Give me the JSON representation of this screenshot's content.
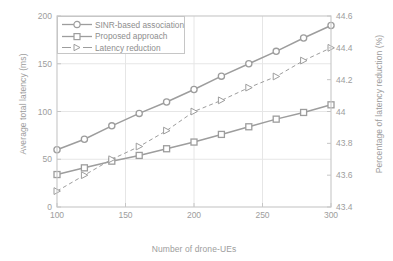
{
  "chart_data": {
    "type": "line",
    "title": "",
    "xlabel": "Number of drone-UEs",
    "ylabel": "Average total latency (ms)",
    "ylabel_right": "Percentage of latency reduction (%)",
    "xlim": [
      100,
      300
    ],
    "ylim": [
      0,
      200
    ],
    "ylim_right": [
      43.4,
      44.6
    ],
    "xticks": [
      100,
      150,
      200,
      250,
      300
    ],
    "yticks": [
      0,
      50,
      100,
      150,
      200
    ],
    "yticks_right": [
      43.4,
      43.6,
      43.8,
      44,
      44.2,
      44.4,
      44.6
    ],
    "xtick_labels": [
      "100",
      "150",
      "200",
      "250",
      "300"
    ],
    "ytick_labels": [
      "0",
      "50",
      "100",
      "150",
      "200"
    ],
    "ytick_right_labels": [
      "43.4",
      "43.6",
      "43.8",
      "44",
      "44.2",
      "44.4",
      "44.6"
    ],
    "grid": true,
    "legend_position": "top-left",
    "x": [
      100,
      120,
      140,
      160,
      180,
      200,
      220,
      240,
      260,
      280,
      300
    ],
    "series": [
      {
        "name": "SINR-based association",
        "axis": "left",
        "marker": "circle",
        "linestyle": "solid",
        "color": "#9d9d9d",
        "values": [
          60,
          71,
          85,
          98,
          110,
          123,
          137,
          150,
          163,
          177,
          190
        ]
      },
      {
        "name": "Proposed approach",
        "axis": "left",
        "marker": "square",
        "linestyle": "solid",
        "color": "#9d9d9d",
        "values": [
          34,
          41,
          48,
          54,
          61,
          68,
          76,
          84,
          92,
          99,
          107
        ]
      },
      {
        "name": "Latency reduction",
        "axis": "right",
        "marker": "triangle-right",
        "linestyle": "dashed",
        "color": "#9d9d9d",
        "values": [
          43.5,
          43.6,
          43.7,
          43.78,
          43.88,
          44.0,
          44.07,
          44.15,
          44.22,
          44.32,
          44.4
        ]
      }
    ]
  },
  "legend": {
    "items": [
      {
        "label": "SINR-based association"
      },
      {
        "label": "Proposed approach"
      },
      {
        "label": "Latency reduction"
      }
    ]
  },
  "colors": {
    "line": "#9d9d9d",
    "axis": "#c6c6c6",
    "grid": "#e6e6e6",
    "text": "#9d9d9d",
    "background": "#ffffff"
  }
}
